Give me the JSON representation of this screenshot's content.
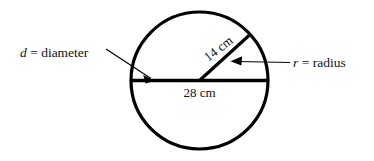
{
  "diagram": {
    "shape": "circle",
    "stroke_color": "#000000",
    "fill_color": "#ffffff",
    "text_color": "#111111",
    "labels": {
      "diameter_callout": {
        "variable": "d",
        "equals": " = ",
        "term": "diameter",
        "full": "d = diameter"
      },
      "radius_callout": {
        "variable": "r",
        "equals": " = ",
        "term": "radius",
        "full": "r = radius"
      },
      "radius_measure": "14 cm",
      "diameter_measure": "28 cm"
    },
    "geometry": {
      "center_x": 199.5,
      "center_y": 80.5,
      "radius_px": 68.5,
      "diameter_line": {
        "x1": 131,
        "y1": 80.5,
        "x2": 268,
        "y2": 80.5
      },
      "radius_line": {
        "x1": 199.5,
        "y1": 80.5,
        "x2": 249,
        "y2": 35
      },
      "radius_label_rotation_deg": -38
    }
  }
}
